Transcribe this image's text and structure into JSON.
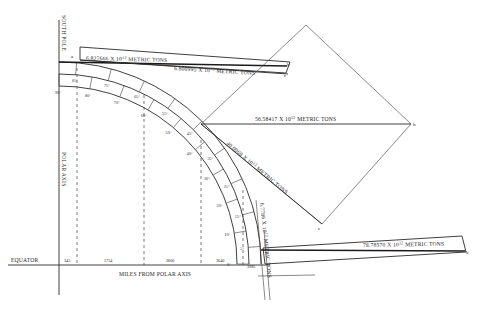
{
  "axes": {
    "south_pole": "SOUTH POLE",
    "polar_axis": "POLAR AXIS",
    "equator": "EQUATOR",
    "miles_label": "MILES FROM POLAR AXIS"
  },
  "miles_ticks": [
    "345",
    "1754",
    "2660",
    "3640",
    "3985"
  ],
  "latitude_labels": {
    "outer": [
      "85°",
      "75°",
      "65°",
      "55°",
      "45°",
      "35°",
      "25°",
      "15°",
      "5°"
    ],
    "inner": [
      "90°",
      "80°",
      "70°",
      "60°",
      "50°",
      "40°",
      "30°",
      "20°",
      "10°",
      "0°"
    ]
  },
  "force_labels": [
    {
      "id": "f1",
      "value": "6.827666",
      "exp": "12",
      "unit": "METRIC TONS"
    },
    {
      "id": "f2",
      "value": "6.800995",
      "exp": "12",
      "unit": "METRIC TONS"
    },
    {
      "id": "f3",
      "value": "56.58417",
      "exp": "12",
      "unit": "METRIC TONS"
    },
    {
      "id": "f4",
      "value": "40.0068",
      "exp": "12",
      "unit": "METRIC TONS"
    },
    {
      "id": "f5",
      "value": "6.7786",
      "exp": "12",
      "unit": "METRIC TONS"
    },
    {
      "id": "f6",
      "value": "78.78570",
      "exp": "12",
      "unit": "METRIC TONS"
    }
  ],
  "times_symbol": "X",
  "ten": "10",
  "point_labels": {
    "a": "a",
    "b": "b",
    "c": "c"
  }
}
